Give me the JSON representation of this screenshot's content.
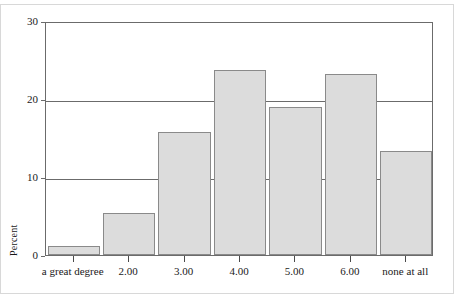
{
  "chart_data": {
    "type": "bar",
    "title": "",
    "subtitle": "",
    "xlabel": "",
    "ylabel": "Percent",
    "categories": [
      "a great degree",
      "2.00",
      "3.00",
      "4.00",
      "5.00",
      "6.00",
      "none at all"
    ],
    "values": [
      1.1,
      5.4,
      15.8,
      23.7,
      19.0,
      23.2,
      13.3
    ],
    "ylim": [
      0,
      30
    ],
    "y_ticks": [
      0,
      10,
      20,
      30
    ],
    "y_tick_labels": [
      "0",
      "10",
      "20",
      "30"
    ],
    "grid": "horizontal",
    "legend": "none",
    "bar_fill_color": "#dcdcdc",
    "bar_border_color": "#8a8a8a",
    "axis_color": "#6b6b6b",
    "background_color": "#ffffff"
  },
  "axes": {
    "y_title": "Percent"
  }
}
